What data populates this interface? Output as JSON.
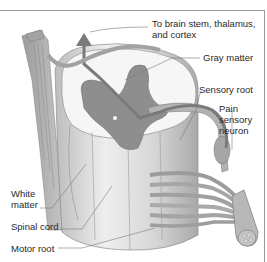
{
  "diagram": {
    "labels": {
      "brain_line1": "To brain stem, thalamus,",
      "brain_line2": "and cortex",
      "gray_matter": "Gray matter",
      "sensory_root": "Sensory root",
      "pain_line1": "Pain",
      "pain_line2": "sensory",
      "pain_line3": "neuron",
      "white_line1": "White",
      "white_line2": "matter",
      "spinal_cord": "Spinal cord",
      "motor_root": "Motor root"
    },
    "colors": {
      "gray_matter": "#8e8e8e",
      "white_matter": "#f4f4f4",
      "cord_shading": "#c9c9c9",
      "nerve": "#a8a8a8",
      "leader_line": "#7a7a7a",
      "text": "#2a2a2a",
      "frame": "#9a9a9a"
    }
  }
}
